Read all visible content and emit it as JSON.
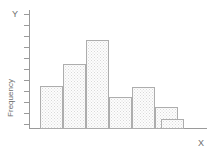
{
  "figure": {
    "background_color": "#ffffff",
    "axis_color": "#9a9a9a",
    "bar_edge_color": "#adadad",
    "bar_fill_color": "#fdfdfd",
    "bar_pattern": "fine-dotted-stipple",
    "width_px": 215,
    "height_px": 153
  },
  "labels": {
    "y_letter": "Y",
    "x_letter": "X",
    "y_title": "Frequency",
    "x_title": ""
  },
  "chart_data": {
    "type": "bar",
    "title": "",
    "subtitle": "",
    "xlabel": "X",
    "ylabel": "Frequency",
    "categories": [
      "1",
      "2",
      "3",
      "4",
      "5",
      "6",
      "7"
    ],
    "values": [
      4,
      6,
      8,
      3,
      4,
      2,
      1
    ],
    "ylim": [
      0,
      11
    ],
    "xlim": [
      0,
      7
    ],
    "grid": false,
    "legend": null,
    "legend_position": "none",
    "xtick_labels": [],
    "ytick_labels": [],
    "y_tick_count": 11,
    "annotations": [],
    "shape_description": "right-skewed unimodal histogram peaking at the third bin",
    "bars": [
      {
        "index": 1,
        "value": 4,
        "top_px": 86,
        "left_px": 40,
        "width_px": 23
      },
      {
        "index": 2,
        "value": 6,
        "top_px": 64,
        "left_px": 63,
        "width_px": 23
      },
      {
        "index": 3,
        "value": 8,
        "top_px": 40,
        "left_px": 86,
        "width_px": 23
      },
      {
        "index": 4,
        "value": 3,
        "top_px": 97,
        "left_px": 109,
        "width_px": 23
      },
      {
        "index": 5,
        "value": 4,
        "top_px": 87,
        "left_px": 132,
        "width_px": 23
      },
      {
        "index": 6,
        "value": 2,
        "top_px": 107,
        "left_px": 155,
        "width_px": 23
      },
      {
        "index": 7,
        "value": 1,
        "top_px": 119,
        "left_px": 161,
        "width_px": 23
      }
    ],
    "baseline_px": 128
  },
  "y_ticks_px": [
    14,
    25,
    36,
    47,
    58,
    69,
    80,
    91,
    102,
    113,
    124
  ]
}
